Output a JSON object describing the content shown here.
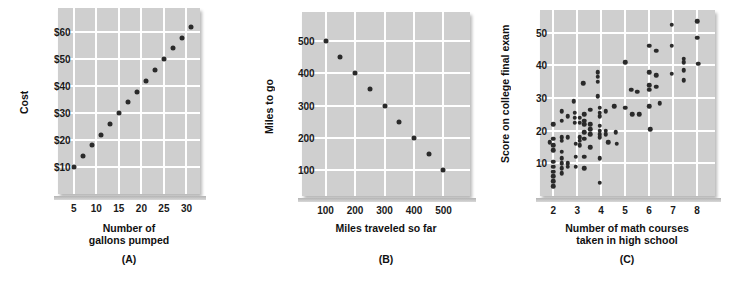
{
  "figure": {
    "background_color": "#ffffff",
    "plot_background_color": "#cfcfcf",
    "gridline_color": "#ffffff",
    "dot_color": "#2a2a2a"
  },
  "chart_data": [
    {
      "type": "scatter",
      "panel": "A",
      "caption": "(A)",
      "title": "",
      "xlabel_line1": "Number of",
      "xlabel_line2": "gallons pumped",
      "ylabel": "Cost",
      "xticks": [
        5,
        10,
        15,
        20,
        25,
        30
      ],
      "xticklabels": [
        "5",
        "10",
        "15",
        "20",
        "25",
        "30"
      ],
      "yticks": [
        10,
        20,
        30,
        40,
        50,
        60
      ],
      "yticklabels": [
        "$10",
        "$20",
        "$30",
        "$40",
        "$50",
        "$60"
      ],
      "xlim": [
        1.5,
        33
      ],
      "ylim": [
        0,
        69
      ],
      "grid": true,
      "relationship": "perfect positive linear",
      "points": [
        {
          "x": 5,
          "y": 10
        },
        {
          "x": 7,
          "y": 14
        },
        {
          "x": 9,
          "y": 18
        },
        {
          "x": 11,
          "y": 22
        },
        {
          "x": 13,
          "y": 26
        },
        {
          "x": 15,
          "y": 30
        },
        {
          "x": 17,
          "y": 34
        },
        {
          "x": 19,
          "y": 38
        },
        {
          "x": 21,
          "y": 42
        },
        {
          "x": 23,
          "y": 46
        },
        {
          "x": 25,
          "y": 50
        },
        {
          "x": 27,
          "y": 54
        },
        {
          "x": 29,
          "y": 58
        },
        {
          "x": 31,
          "y": 62
        }
      ]
    },
    {
      "type": "scatter",
      "panel": "B",
      "caption": "(B)",
      "title": "",
      "xlabel_line1": "Miles traveled so far",
      "xlabel_line2": "",
      "ylabel": "Miles to go",
      "xticks": [
        100,
        200,
        300,
        400,
        500
      ],
      "xticklabels": [
        "100",
        "200",
        "300",
        "400",
        "500"
      ],
      "yticks": [
        100,
        200,
        300,
        400,
        500
      ],
      "yticklabels": [
        "100",
        "200",
        "300",
        "400",
        "500"
      ],
      "xlim": [
        20,
        590
      ],
      "ylim": [
        20,
        590
      ],
      "grid": true,
      "relationship": "perfect negative linear",
      "points": [
        {
          "x": 100,
          "y": 500
        },
        {
          "x": 150,
          "y": 450
        },
        {
          "x": 200,
          "y": 400
        },
        {
          "x": 250,
          "y": 350
        },
        {
          "x": 300,
          "y": 300
        },
        {
          "x": 350,
          "y": 250
        },
        {
          "x": 400,
          "y": 200
        },
        {
          "x": 450,
          "y": 150
        },
        {
          "x": 500,
          "y": 100
        }
      ]
    },
    {
      "type": "scatter",
      "panel": "C",
      "caption": "(C)",
      "title": "",
      "xlabel_line1": "Number of math courses",
      "xlabel_line2": "taken in high school",
      "ylabel": "Score on college final exam",
      "xticks": [
        2,
        3,
        4,
        5,
        6,
        7,
        8
      ],
      "xticklabels": [
        "2",
        "3",
        "4",
        "5",
        "6",
        "7",
        "8"
      ],
      "yticks": [
        10,
        20,
        30,
        40,
        50
      ],
      "yticklabels": [
        "10",
        "20",
        "30",
        "40",
        "50"
      ],
      "xlim": [
        1.45,
        8.75
      ],
      "ylim": [
        0,
        57
      ],
      "grid": true,
      "relationship": "moderate positive scatter",
      "points": [
        {
          "x": 1.85,
          "y": 16.5
        },
        {
          "x": 2.0,
          "y": 22.0
        },
        {
          "x": 2.0,
          "y": 17.5
        },
        {
          "x": 2.0,
          "y": 15.5
        },
        {
          "x": 2.0,
          "y": 14.0
        },
        {
          "x": 2.0,
          "y": 10.5
        },
        {
          "x": 2.0,
          "y": 9.0
        },
        {
          "x": 2.0,
          "y": 7.5
        },
        {
          "x": 2.0,
          "y": 6.0
        },
        {
          "x": 2.0,
          "y": 4.5
        },
        {
          "x": 2.0,
          "y": 3.0
        },
        {
          "x": 2.35,
          "y": 26.0
        },
        {
          "x": 2.35,
          "y": 23.0
        },
        {
          "x": 2.35,
          "y": 18.0
        },
        {
          "x": 2.35,
          "y": 17.0
        },
        {
          "x": 2.35,
          "y": 13.5
        },
        {
          "x": 2.35,
          "y": 11.5
        },
        {
          "x": 2.35,
          "y": 10.0
        },
        {
          "x": 2.35,
          "y": 8.5
        },
        {
          "x": 2.35,
          "y": 7.0
        },
        {
          "x": 2.6,
          "y": 24.5
        },
        {
          "x": 2.6,
          "y": 18.0
        },
        {
          "x": 2.6,
          "y": 10.0
        },
        {
          "x": 2.6,
          "y": 9.0
        },
        {
          "x": 2.85,
          "y": 29.0
        },
        {
          "x": 2.9,
          "y": 25.5
        },
        {
          "x": 2.9,
          "y": 24.0
        },
        {
          "x": 2.9,
          "y": 22.5
        },
        {
          "x": 2.95,
          "y": 16.0
        },
        {
          "x": 2.95,
          "y": 12.0
        },
        {
          "x": 2.95,
          "y": 9.0
        },
        {
          "x": 3.1,
          "y": 24.0
        },
        {
          "x": 3.1,
          "y": 22.5
        },
        {
          "x": 3.1,
          "y": 18.0
        },
        {
          "x": 3.1,
          "y": 17.0
        },
        {
          "x": 3.1,
          "y": 15.5
        },
        {
          "x": 3.25,
          "y": 34.5
        },
        {
          "x": 3.3,
          "y": 25.0
        },
        {
          "x": 3.3,
          "y": 23.0
        },
        {
          "x": 3.3,
          "y": 22.0
        },
        {
          "x": 3.3,
          "y": 19.5
        },
        {
          "x": 3.3,
          "y": 17.5
        },
        {
          "x": 3.3,
          "y": 12.0
        },
        {
          "x": 3.3,
          "y": 8.5
        },
        {
          "x": 3.55,
          "y": 26.5
        },
        {
          "x": 3.55,
          "y": 22.0
        },
        {
          "x": 3.55,
          "y": 20.5
        },
        {
          "x": 3.55,
          "y": 19.0
        },
        {
          "x": 3.55,
          "y": 15.0
        },
        {
          "x": 3.85,
          "y": 38.0
        },
        {
          "x": 3.85,
          "y": 36.5
        },
        {
          "x": 3.85,
          "y": 35.0
        },
        {
          "x": 3.85,
          "y": 30.5
        },
        {
          "x": 3.95,
          "y": 27.0
        },
        {
          "x": 3.95,
          "y": 25.5
        },
        {
          "x": 3.95,
          "y": 24.5
        },
        {
          "x": 3.95,
          "y": 21.5
        },
        {
          "x": 3.95,
          "y": 20.0
        },
        {
          "x": 3.95,
          "y": 19.0
        },
        {
          "x": 3.95,
          "y": 18.0
        },
        {
          "x": 3.95,
          "y": 11.5
        },
        {
          "x": 3.95,
          "y": 4.0
        },
        {
          "x": 4.2,
          "y": 26.0
        },
        {
          "x": 4.2,
          "y": 20.0
        },
        {
          "x": 4.2,
          "y": 19.0
        },
        {
          "x": 4.3,
          "y": 16.5
        },
        {
          "x": 4.55,
          "y": 27.5
        },
        {
          "x": 4.6,
          "y": 19.5
        },
        {
          "x": 4.65,
          "y": 16.0
        },
        {
          "x": 5.0,
          "y": 41.0
        },
        {
          "x": 5.0,
          "y": 27.0
        },
        {
          "x": 5.25,
          "y": 32.5
        },
        {
          "x": 5.3,
          "y": 25.0
        },
        {
          "x": 5.5,
          "y": 32.0
        },
        {
          "x": 5.6,
          "y": 25.0
        },
        {
          "x": 6.0,
          "y": 46.0
        },
        {
          "x": 6.0,
          "y": 38.0
        },
        {
          "x": 6.0,
          "y": 34.0
        },
        {
          "x": 6.0,
          "y": 32.5
        },
        {
          "x": 6.0,
          "y": 27.5
        },
        {
          "x": 6.05,
          "y": 20.5
        },
        {
          "x": 6.3,
          "y": 44.5
        },
        {
          "x": 6.3,
          "y": 37.0
        },
        {
          "x": 6.3,
          "y": 33.5
        },
        {
          "x": 6.45,
          "y": 28.5
        },
        {
          "x": 6.95,
          "y": 52.5
        },
        {
          "x": 6.95,
          "y": 46.0
        },
        {
          "x": 6.95,
          "y": 37.5
        },
        {
          "x": 7.45,
          "y": 42.0
        },
        {
          "x": 7.45,
          "y": 41.0
        },
        {
          "x": 7.45,
          "y": 38.5
        },
        {
          "x": 7.45,
          "y": 35.5
        },
        {
          "x": 8.0,
          "y": 53.5
        },
        {
          "x": 8.0,
          "y": 48.5
        },
        {
          "x": 8.05,
          "y": 40.5
        }
      ]
    }
  ]
}
